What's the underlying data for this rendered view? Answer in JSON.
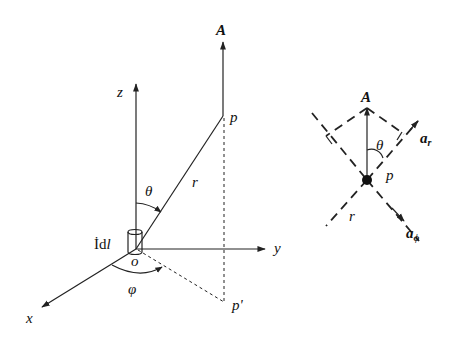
{
  "left_diagram": {
    "vector_label": "A",
    "point_label": "p",
    "projection_label": "p'",
    "radius_label": "r",
    "theta_label": "θ",
    "phi_label": "φ",
    "origin_label": "o",
    "current_element_label_I": "İ",
    "current_element_label_d": "d",
    "current_element_label_l": "l",
    "axes": {
      "x": "x",
      "y": "y",
      "z": "z"
    }
  },
  "right_diagram": {
    "vector_label": "A",
    "theta_label": "θ",
    "point_label": "p",
    "radius_label": "r",
    "unit_r_base": "a",
    "unit_r_sub": "r",
    "unit_phi_base": "a",
    "unit_phi_sub": "ϕ"
  }
}
